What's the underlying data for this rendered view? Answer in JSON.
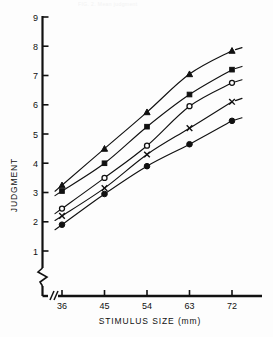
{
  "figure": {
    "clipped_caption": "FIG. 2.  Mean judgment",
    "background_color": "#fdfdfd",
    "ink_color": "#111111"
  },
  "chart_data": {
    "type": "line",
    "title": "",
    "subtitle": "",
    "xlabel": "STIMULUS  SIZE (mm)",
    "ylabel": "JUDGMENT",
    "x": [
      36,
      45,
      54,
      63,
      72
    ],
    "categories": [
      "36",
      "45",
      "54",
      "63",
      "72"
    ],
    "xtick_labels": [
      "36",
      "45",
      "54",
      "63",
      "72"
    ],
    "ytick_labels": [
      "1",
      "2",
      "3",
      "4",
      "5",
      "6",
      "7",
      "8",
      "9"
    ],
    "ytick_values": [
      1,
      2,
      3,
      4,
      5,
      6,
      7,
      8,
      9
    ],
    "xlim": [
      36,
      72
    ],
    "ylim": [
      1,
      9
    ],
    "grid": false,
    "legend": "none",
    "x_axis_break": true,
    "y_axis_break": true,
    "axis_break_note": "zigzag break on y-axis below 1; double-slash break on x-axis left of 36",
    "series": [
      {
        "name": "Series A",
        "marker": "filled-triangle",
        "marker_glyph": "triangle",
        "values": [
          3.25,
          4.5,
          5.75,
          7.05,
          7.85
        ]
      },
      {
        "name": "Series B",
        "marker": "filled-square",
        "marker_glyph": "square",
        "values": [
          3.05,
          4.0,
          5.25,
          6.35,
          7.2
        ]
      },
      {
        "name": "Series C",
        "marker": "open-circle",
        "marker_glyph": "circle-open",
        "values": [
          2.45,
          3.5,
          4.6,
          5.95,
          6.75
        ]
      },
      {
        "name": "Series D",
        "marker": "cross",
        "marker_glyph": "x",
        "values": [
          2.2,
          3.15,
          4.3,
          5.2,
          6.1
        ]
      },
      {
        "name": "Series E",
        "marker": "filled-circle",
        "marker_glyph": "circle-filled",
        "values": [
          1.9,
          2.95,
          3.9,
          4.65,
          5.45
        ]
      }
    ]
  }
}
